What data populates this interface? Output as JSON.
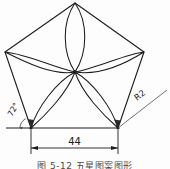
{
  "figure": {
    "type": "engineering-drawing",
    "caption": "图 5-12   五星图案图形",
    "line_color": "#1c1c1c",
    "thin_line_color": "#555555",
    "background_color": "#fdfdfd"
  },
  "annotations": {
    "angle_label": "72°",
    "radius_label": "R2",
    "width_dimension": "44"
  },
  "geometry": {
    "center": {
      "x": 75,
      "y": 72
    },
    "vertices": [
      {
        "name": "apex",
        "x": 75,
        "y": 3
      },
      {
        "name": "right-upper",
        "x": 144,
        "y": 52
      },
      {
        "name": "right-lower",
        "x": 118,
        "y": 128
      },
      {
        "name": "left-lower",
        "x": 31,
        "y": 128
      },
      {
        "name": "left-upper",
        "x": 5,
        "y": 52
      }
    ],
    "petal_count": 5,
    "dimension_line": {
      "x1": 31,
      "x2": 118,
      "y": 148
    },
    "radius_leader": {
      "x1": 118,
      "y1": 128,
      "x2": 167,
      "y2": 90
    }
  }
}
